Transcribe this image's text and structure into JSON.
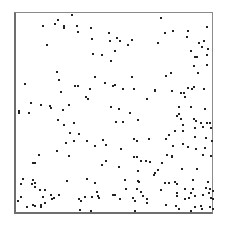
{
  "chart_data": {
    "type": "scatter",
    "title": "",
    "xlabel": "",
    "ylabel": "",
    "grid": false,
    "legend": null,
    "frame": {
      "x0": 14,
      "y0": 12,
      "x1": 214,
      "y1": 215
    },
    "marker": {
      "color": "#222222",
      "size": 2
    },
    "coordinate_note": "points given in pixel coordinates within the 227x229 image (y grows downward)",
    "points": [
      [
        43,
        26
      ],
      [
        55,
        24
      ],
      [
        58,
        20
      ],
      [
        64,
        26
      ],
      [
        64,
        28
      ],
      [
        72,
        15
      ],
      [
        77,
        26
      ],
      [
        78,
        32
      ],
      [
        91,
        28
      ],
      [
        92,
        39
      ],
      [
        47,
        45
      ],
      [
        109,
        33
      ],
      [
        110,
        41
      ],
      [
        93,
        54
      ],
      [
        102,
        55
      ],
      [
        111,
        61
      ],
      [
        161,
        18
      ],
      [
        173,
        31
      ],
      [
        165,
        33
      ],
      [
        188,
        31
      ],
      [
        187,
        37
      ],
      [
        207,
        27
      ],
      [
        117,
        38
      ],
      [
        120,
        41
      ],
      [
        132,
        40
      ],
      [
        128,
        45
      ],
      [
        158,
        43
      ],
      [
        115,
        51
      ],
      [
        199,
        43
      ],
      [
        204,
        41
      ],
      [
        202,
        47
      ],
      [
        191,
        51
      ],
      [
        208,
        49
      ],
      [
        207,
        55
      ],
      [
        195,
        57
      ],
      [
        197,
        57
      ],
      [
        57,
        72
      ],
      [
        59,
        80
      ],
      [
        25,
        84
      ],
      [
        75,
        86
      ],
      [
        78,
        86
      ],
      [
        95,
        77
      ],
      [
        105,
        83
      ],
      [
        113,
        86
      ],
      [
        90,
        89
      ],
      [
        61,
        92
      ],
      [
        86,
        97
      ],
      [
        88,
        99
      ],
      [
        31,
        103
      ],
      [
        41,
        105
      ],
      [
        50,
        106
      ],
      [
        51,
        108
      ],
      [
        69,
        105
      ],
      [
        63,
        110
      ],
      [
        19,
        111
      ],
      [
        111,
        107
      ],
      [
        194,
        66
      ],
      [
        207,
        65
      ],
      [
        198,
        73
      ],
      [
        132,
        77
      ],
      [
        166,
        76
      ],
      [
        171,
        73
      ],
      [
        115,
        85
      ],
      [
        123,
        89
      ],
      [
        134,
        89
      ],
      [
        155,
        90
      ],
      [
        155,
        91
      ],
      [
        172,
        91
      ],
      [
        188,
        88
      ],
      [
        194,
        87
      ],
      [
        192,
        89
      ],
      [
        204,
        89
      ],
      [
        181,
        93
      ],
      [
        184,
        93
      ],
      [
        185,
        97
      ],
      [
        147,
        99
      ],
      [
        119,
        109
      ],
      [
        179,
        107
      ],
      [
        191,
        107
      ],
      [
        205,
        109
      ],
      [
        19,
        113
      ],
      [
        29,
        113
      ],
      [
        58,
        120
      ],
      [
        64,
        125
      ],
      [
        74,
        123
      ],
      [
        70,
        133
      ],
      [
        79,
        134
      ],
      [
        66,
        143
      ],
      [
        74,
        141
      ],
      [
        87,
        141
      ],
      [
        95,
        146
      ],
      [
        103,
        140
      ],
      [
        106,
        145
      ],
      [
        39,
        155
      ],
      [
        57,
        151
      ],
      [
        69,
        156
      ],
      [
        33,
        163
      ],
      [
        35,
        163
      ],
      [
        106,
        161
      ],
      [
        130,
        113
      ],
      [
        116,
        122
      ],
      [
        123,
        122
      ],
      [
        138,
        120
      ],
      [
        179,
        114
      ],
      [
        177,
        116
      ],
      [
        181,
        119
      ],
      [
        183,
        125
      ],
      [
        194,
        119
      ],
      [
        196,
        121
      ],
      [
        201,
        123
      ],
      [
        207,
        123
      ],
      [
        210,
        123
      ],
      [
        195,
        128
      ],
      [
        203,
        127
      ],
      [
        211,
        128
      ],
      [
        175,
        131
      ],
      [
        169,
        135
      ],
      [
        183,
        131
      ],
      [
        166,
        139
      ],
      [
        134,
        139
      ],
      [
        137,
        141
      ],
      [
        149,
        139
      ],
      [
        195,
        137
      ],
      [
        206,
        138
      ],
      [
        212,
        141
      ],
      [
        183,
        144
      ],
      [
        121,
        149
      ],
      [
        173,
        146
      ],
      [
        188,
        147
      ],
      [
        196,
        149
      ],
      [
        205,
        148
      ],
      [
        134,
        157
      ],
      [
        137,
        157
      ],
      [
        167,
        155
      ],
      [
        172,
        156
      ],
      [
        172,
        157
      ],
      [
        141,
        161
      ],
      [
        146,
        161
      ],
      [
        150,
        162
      ],
      [
        162,
        163
      ],
      [
        203,
        155
      ],
      [
        211,
        156
      ],
      [
        23,
        179
      ],
      [
        21,
        184
      ],
      [
        33,
        180
      ],
      [
        35,
        183
      ],
      [
        32,
        184
      ],
      [
        35,
        187
      ],
      [
        40,
        190
      ],
      [
        45,
        190
      ],
      [
        21,
        197
      ],
      [
        18,
        201
      ],
      [
        43,
        197
      ],
      [
        51,
        195
      ],
      [
        52,
        199
      ],
      [
        54,
        198
      ],
      [
        59,
        195
      ],
      [
        67,
        181
      ],
      [
        87,
        179
      ],
      [
        95,
        183
      ],
      [
        97,
        192
      ],
      [
        98,
        196
      ],
      [
        99,
        198
      ],
      [
        79,
        199
      ],
      [
        85,
        197
      ],
      [
        92,
        197
      ],
      [
        81,
        201
      ],
      [
        27,
        207
      ],
      [
        33,
        205
      ],
      [
        35,
        206
      ],
      [
        41,
        205
      ],
      [
        41,
        207
      ],
      [
        45,
        203
      ],
      [
        80,
        210
      ],
      [
        91,
        211
      ],
      [
        113,
        195
      ],
      [
        102,
        165
      ],
      [
        119,
        167
      ],
      [
        138,
        171
      ],
      [
        158,
        170
      ],
      [
        155,
        173
      ],
      [
        154,
        175
      ],
      [
        182,
        169
      ],
      [
        197,
        169
      ],
      [
        125,
        180
      ],
      [
        138,
        181
      ],
      [
        139,
        182
      ],
      [
        165,
        183
      ],
      [
        169,
        183
      ],
      [
        175,
        182
      ],
      [
        177,
        184
      ],
      [
        193,
        180
      ],
      [
        208,
        182
      ],
      [
        126,
        189
      ],
      [
        137,
        189
      ],
      [
        141,
        192
      ],
      [
        161,
        190
      ],
      [
        185,
        189
      ],
      [
        193,
        189
      ],
      [
        206,
        188
      ],
      [
        210,
        189
      ],
      [
        213,
        191
      ],
      [
        115,
        195
      ],
      [
        133,
        198
      ],
      [
        143,
        196
      ],
      [
        147,
        199
      ],
      [
        120,
        199
      ],
      [
        177,
        193
      ],
      [
        177,
        196
      ],
      [
        191,
        193
      ],
      [
        185,
        199
      ],
      [
        189,
        198
      ],
      [
        195,
        196
      ],
      [
        203,
        195
      ],
      [
        209,
        193
      ],
      [
        211,
        198
      ],
      [
        213,
        199
      ],
      [
        135,
        201
      ],
      [
        147,
        203
      ],
      [
        166,
        205
      ],
      [
        176,
        206
      ],
      [
        179,
        209
      ],
      [
        195,
        207
      ],
      [
        201,
        206
      ],
      [
        202,
        209
      ],
      [
        210,
        207
      ],
      [
        191,
        211
      ],
      [
        213,
        209
      ],
      [
        135,
        211
      ]
    ]
  }
}
